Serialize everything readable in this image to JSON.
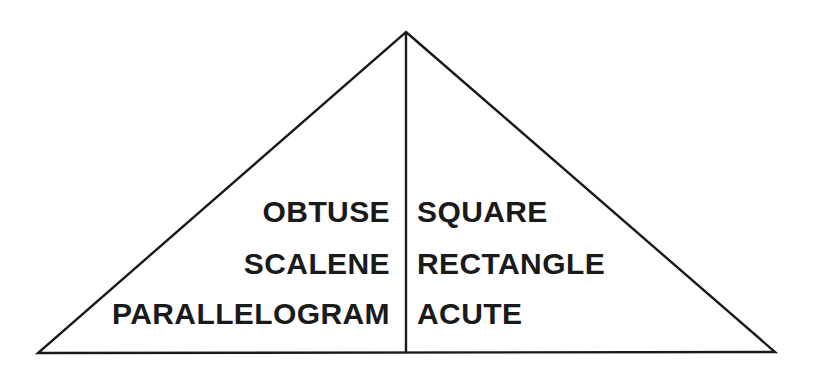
{
  "diagram": {
    "shape_name": "triangle",
    "divider_name": "vertical-divider",
    "stroke_color": "#1a1a1a",
    "background_color": "#ffffff",
    "apex": {
      "x": 406,
      "y": 32
    },
    "bottom_left": {
      "x": 38,
      "y": 353
    },
    "bottom_right": {
      "x": 775,
      "y": 352
    },
    "stroke_width": 2.4,
    "columns": [
      {
        "side": "left",
        "align": "right",
        "terms": [
          {
            "label": "OBTUSE"
          },
          {
            "label": "SCALENE"
          },
          {
            "label": "PARALLELOGRAM"
          }
        ]
      },
      {
        "side": "right",
        "align": "left",
        "terms": [
          {
            "label": "SQUARE"
          },
          {
            "label": "RECTANGLE"
          },
          {
            "label": "ACUTE"
          }
        ]
      }
    ]
  }
}
